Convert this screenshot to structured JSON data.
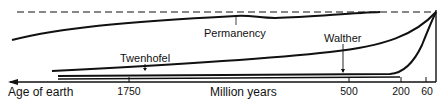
{
  "diagram": {
    "axis": {
      "left_label": "Age of earth",
      "center_label": "Million years",
      "ticks": [
        {
          "label": "1750",
          "x": 129
        },
        {
          "label": "500",
          "x": 349
        },
        {
          "label": "200",
          "x": 401
        },
        {
          "label": "60",
          "x": 426
        }
      ]
    },
    "curves": {
      "permanency": {
        "label": "Permanency"
      },
      "walther": {
        "label": "Walther"
      },
      "twenhofel": {
        "label": "Twenhofel"
      }
    },
    "colors": {
      "line": "#111111",
      "background": "#ffffff"
    }
  }
}
